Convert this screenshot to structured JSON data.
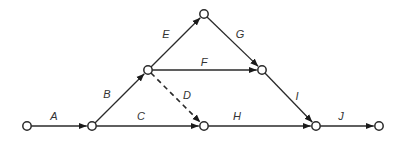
{
  "diagram": {
    "type": "activity-on-arrow network",
    "nodes": [
      {
        "id": "1",
        "x": 27,
        "y": 126
      },
      {
        "id": "2",
        "x": 92,
        "y": 126
      },
      {
        "id": "3",
        "x": 148,
        "y": 70
      },
      {
        "id": "4",
        "x": 204,
        "y": 14
      },
      {
        "id": "5",
        "x": 262,
        "y": 70
      },
      {
        "id": "6",
        "x": 204,
        "y": 126
      },
      {
        "id": "7",
        "x": 316,
        "y": 126
      },
      {
        "id": "8",
        "x": 379,
        "y": 126
      }
    ],
    "edges": [
      {
        "label": "A",
        "from": "1",
        "to": "2",
        "dashed": false,
        "lx": 54,
        "ly": 120
      },
      {
        "label": "B",
        "from": "2",
        "to": "3",
        "dashed": false,
        "lx": 107,
        "ly": 98
      },
      {
        "label": "C",
        "from": "2",
        "to": "6",
        "dashed": false,
        "lx": 141,
        "ly": 120
      },
      {
        "label": "D",
        "from": "3",
        "to": "6",
        "dashed": true,
        "lx": 187,
        "ly": 99
      },
      {
        "label": "E",
        "from": "3",
        "to": "4",
        "dashed": false,
        "lx": 166,
        "ly": 38
      },
      {
        "label": "F",
        "from": "3",
        "to": "5",
        "dashed": false,
        "lx": 204,
        "ly": 66
      },
      {
        "label": "G",
        "from": "4",
        "to": "5",
        "dashed": false,
        "lx": 240,
        "ly": 38
      },
      {
        "label": "H",
        "from": "6",
        "to": "7",
        "dashed": false,
        "lx": 237,
        "ly": 120
      },
      {
        "label": "I",
        "from": "5",
        "to": "7",
        "dashed": false,
        "lx": 297,
        "ly": 100
      },
      {
        "label": "J",
        "from": "7",
        "to": "8",
        "dashed": false,
        "lx": 341,
        "ly": 120
      }
    ]
  }
}
